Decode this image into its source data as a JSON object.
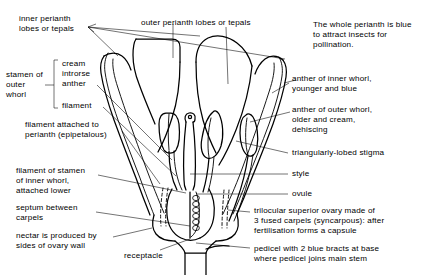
{
  "figure": {
    "type": "botanical-line-diagram",
    "background_color": "#ffffff",
    "ink_color": "#000000"
  },
  "labels": {
    "outer_perianth": "outer perianth lobes or tepals",
    "inner_perianth": "inner perianth\nlobes or tepals",
    "perianth_note": "The whole perianth is blue\nto attract insects for\npollination.",
    "stamen_outer_whorl": "stamen of\nouter\nwhorl",
    "cream_introrse_anther": "cream\nintrorse\nanther",
    "filament": "filament",
    "filament_attached": "filament attached to\nperianth (epipetalous)",
    "filament_inner_whorl": "filament of stamen\nof inner whorl,\nattached lower",
    "septum_between_carpels": "septum between\ncarpels",
    "nectar": "nectar is produced by\nsides of ovary wall",
    "receptacle": "receptacle",
    "anther_inner_whorl": "anther of inner whorl,\nyounger and blue",
    "anther_outer_whorl": "anther of outer whorl,\nolder and cream,\ndehiscing",
    "stigma": "triangularly-lobed stigma",
    "style": "style",
    "ovule": "ovule",
    "ovary": "trilocular superior ovary made of\n3 fused carpels (syncarpous): after\nfertilisation forms a capsule",
    "pedicel": "pedicel with 2 blue bracts at base\nwhere pedicel joins main stem"
  }
}
